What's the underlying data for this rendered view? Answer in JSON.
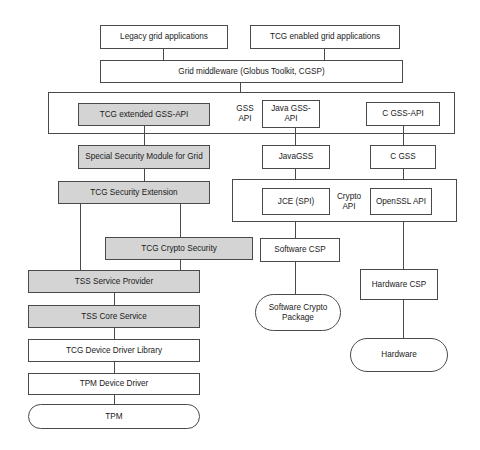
{
  "diagram": {
    "colors": {
      "shaded_fill": "#d4d4d4",
      "plain_fill": "#ffffff",
      "stroke": "#4a4a4a",
      "text": "#1a1a1a",
      "background": "#ffffff"
    },
    "nodes": [
      {
        "id": "legacy_grid_apps",
        "label": "Legacy grid applications",
        "shape": "rect",
        "fill": "plain"
      },
      {
        "id": "tcg_enabled_grid_apps",
        "label": "TCG enabled  grid applications",
        "shape": "rect",
        "fill": "plain"
      },
      {
        "id": "grid_middleware",
        "label": "Grid middleware (Globus Toolkit, CGSP)",
        "shape": "rect",
        "fill": "plain"
      },
      {
        "id": "tcg_extended_gss_api",
        "label": "TCG extended GSS-API",
        "shape": "rect",
        "fill": "shaded"
      },
      {
        "id": "java_gss_api",
        "label": "Java GSS-API",
        "shape": "rect",
        "fill": "plain"
      },
      {
        "id": "c_gss_api",
        "label": "C GSS-API",
        "shape": "rect",
        "fill": "plain"
      },
      {
        "id": "special_security_module",
        "label": "Special Security Module for Grid",
        "shape": "rect",
        "fill": "shaded"
      },
      {
        "id": "java_gss",
        "label": "JavaGSS",
        "shape": "rect",
        "fill": "plain"
      },
      {
        "id": "c_gss",
        "label": "C GSS",
        "shape": "rect",
        "fill": "plain"
      },
      {
        "id": "tcg_security_extension",
        "label": "TCG Security Extension",
        "shape": "rect",
        "fill": "shaded"
      },
      {
        "id": "jce_spi",
        "label": "JCE (SPI)",
        "shape": "rect",
        "fill": "plain"
      },
      {
        "id": "openssl_api",
        "label": "OpenSSL API",
        "shape": "rect",
        "fill": "plain"
      },
      {
        "id": "tcg_crypto_security",
        "label": "TCG Crypto Security",
        "shape": "rect",
        "fill": "shaded"
      },
      {
        "id": "software_csp",
        "label": "Software  CSP",
        "shape": "rect",
        "fill": "plain"
      },
      {
        "id": "hardware_csp",
        "label": "Hardware  CSP",
        "shape": "rect",
        "fill": "plain"
      },
      {
        "id": "tss_service_provider",
        "label": "TSS Service Provider",
        "shape": "rect",
        "fill": "shaded"
      },
      {
        "id": "tss_core_service",
        "label": "TSS Core Service",
        "shape": "rect",
        "fill": "shaded"
      },
      {
        "id": "tcg_device_driver_lib",
        "label": "TCG Device Driver Library",
        "shape": "rect",
        "fill": "plain"
      },
      {
        "id": "tpm_device_driver",
        "label": "TPM Device Driver",
        "shape": "rect",
        "fill": "plain"
      },
      {
        "id": "tpm",
        "label": "TPM",
        "shape": "rounded",
        "fill": "plain"
      },
      {
        "id": "software_crypto_package",
        "label": "Software Crypto Package",
        "shape": "rounded",
        "fill": "plain"
      },
      {
        "id": "hardware",
        "label": "Hardware",
        "shape": "rounded",
        "fill": "plain"
      }
    ],
    "group_labels": [
      {
        "id": "gss_api_label",
        "label": "GSS API"
      },
      {
        "id": "crypto_api_label",
        "label": "Crypto API"
      }
    ],
    "groups": [
      {
        "id": "gss_api_layer",
        "label": ""
      },
      {
        "id": "crypto_api_layer",
        "label": ""
      }
    ],
    "edges": [
      {
        "from": "legacy_grid_apps",
        "to": "grid_middleware"
      },
      {
        "from": "tcg_enabled_grid_apps",
        "to": "grid_middleware"
      },
      {
        "from": "grid_middleware",
        "to": "gss_api_layer"
      },
      {
        "from": "tcg_extended_gss_api",
        "to": "special_security_module"
      },
      {
        "from": "java_gss_api",
        "to": "java_gss"
      },
      {
        "from": "c_gss_api",
        "to": "c_gss"
      },
      {
        "from": "special_security_module",
        "to": "tcg_security_extension"
      },
      {
        "from": "java_gss",
        "to": "crypto_api_layer"
      },
      {
        "from": "c_gss",
        "to": "crypto_api_layer"
      },
      {
        "from": "tcg_security_extension",
        "to": "tcg_crypto_security"
      },
      {
        "from": "tcg_security_extension",
        "to": "tss_service_provider"
      },
      {
        "from": "tcg_crypto_security",
        "to": "tss_service_provider"
      },
      {
        "from": "jce_spi",
        "to": "software_csp"
      },
      {
        "from": "openssl_api",
        "to": "hardware_csp"
      },
      {
        "from": "tss_service_provider",
        "to": "tss_core_service"
      },
      {
        "from": "tss_core_service",
        "to": "tcg_device_driver_lib"
      },
      {
        "from": "tcg_device_driver_lib",
        "to": "tpm_device_driver"
      },
      {
        "from": "tpm_device_driver",
        "to": "tpm"
      },
      {
        "from": "software_csp",
        "to": "software_crypto_package"
      },
      {
        "from": "hardware_csp",
        "to": "hardware"
      }
    ]
  }
}
